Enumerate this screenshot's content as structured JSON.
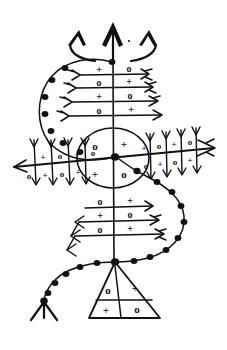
{
  "artwork": {
    "title": "Veve Ritual Diagram",
    "background_color": "#ffffff",
    "ink_color": "#111111",
    "width": 227,
    "height": 350
  },
  "symbols": {
    "cross": "+",
    "circle": "o"
  },
  "top_crown": {
    "name": "triple-chevron-crown",
    "spikes": 3,
    "labels": [
      "left-chevron",
      "center-chevron",
      "right-chevron"
    ]
  },
  "top_grid": {
    "name": "upper-ladder-grid",
    "rows": 4,
    "cols": 2,
    "cells": [
      [
        "+",
        "o"
      ],
      [
        "o",
        "+"
      ],
      [
        "+",
        "o"
      ],
      [
        "o",
        "+"
      ]
    ],
    "row_arrow_direction": "right",
    "row_feather_side": "left"
  },
  "center_circle": {
    "name": "central-quadrant-circle",
    "rows": 2,
    "cols": 2,
    "cells": [
      [
        "o",
        "+"
      ],
      [
        "+",
        "o"
      ]
    ]
  },
  "left_grid": {
    "name": "left-wing-grid",
    "rows": 2,
    "cols": 4,
    "cells": [
      [
        "+",
        "o",
        "+",
        "o"
      ],
      [
        "o",
        "+",
        "o",
        "+"
      ]
    ],
    "column_arrow_direction": "down"
  },
  "right_grid": {
    "name": "right-wing-grid",
    "rows": 2,
    "cols": 4,
    "cells": [
      [
        "+",
        "o",
        "+",
        "o"
      ],
      [
        "o",
        "+",
        "o",
        "+"
      ]
    ],
    "column_arrow_direction": "down"
  },
  "bottom_grid": {
    "name": "lower-ladder-grid",
    "rows": 3,
    "cols": 2,
    "cells": [
      [
        "o",
        "+"
      ],
      [
        "+",
        "o"
      ],
      [
        "o",
        "+"
      ]
    ],
    "row_arrow_direction": "both",
    "row_feather_side": "right"
  },
  "triangle": {
    "name": "base-triangle-grid",
    "rows": 2,
    "cols": 2,
    "cells": [
      [
        "o",
        "+"
      ],
      [
        "+",
        "o"
      ]
    ]
  },
  "horizontal_axis": {
    "name": "main-horizontal-arrow",
    "left_arrowhead": true,
    "right_arrowhead": true
  },
  "vertical_axis": {
    "name": "main-vertical-spine"
  },
  "serpent_chain": {
    "name": "beaded-serpent-chain",
    "bead_count": 27,
    "tail": "forked-trident-tail",
    "tail_position": "bottom-left"
  }
}
